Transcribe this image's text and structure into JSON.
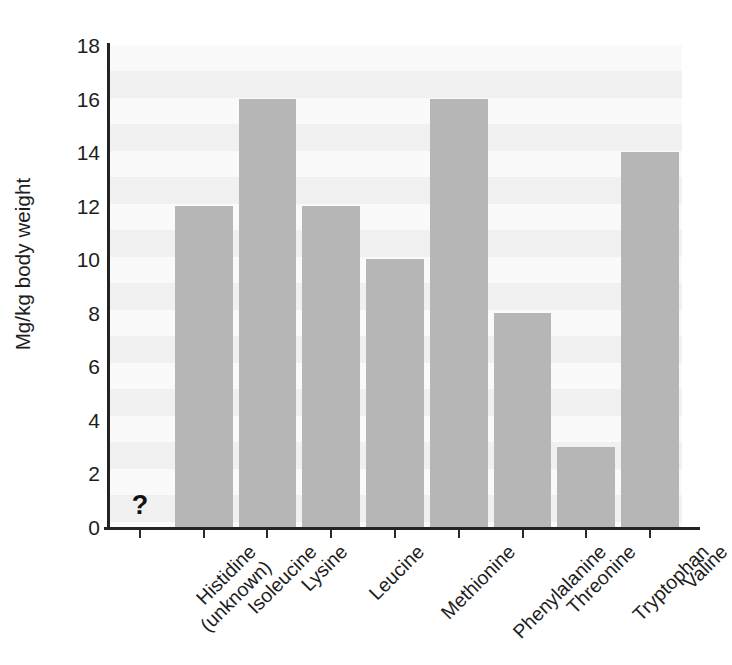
{
  "chart_data": {
    "type": "bar",
    "title": "",
    "subtitle": "",
    "xlabel": "",
    "ylabel": "Mg/kg body weight",
    "ylim": [
      0,
      18
    ],
    "ytick_step": 2,
    "yticks": [
      18,
      16,
      14,
      12,
      10,
      8,
      6,
      4,
      2,
      0
    ],
    "grid": false,
    "legend": null,
    "categories": [
      "Histidine (unknown)",
      "Isoleucine",
      "Lysine",
      "Leucine",
      "Methionine",
      "Phenylalanine",
      "Threonine",
      "Tryptophan",
      "Valine"
    ],
    "category_lines": [
      [
        "Histidine",
        "(unknown)"
      ],
      [
        "Isoleucine",
        ""
      ],
      [
        "Lysine",
        ""
      ],
      [
        "Leucine",
        ""
      ],
      [
        "Methionine",
        ""
      ],
      [
        "Phenylalanine",
        ""
      ],
      [
        "Threonine",
        ""
      ],
      [
        "Tryptophan",
        ""
      ],
      [
        "Valine",
        ""
      ]
    ],
    "values": [
      null,
      12,
      16,
      12,
      10,
      16,
      8,
      3,
      14
    ],
    "annotations": [
      {
        "category": "Histidine (unknown)",
        "text": "?",
        "note": "value unknown, question mark drawn at baseline"
      }
    ],
    "colors": {
      "bar": "#b6b6b6",
      "plot_background": "#f3f3f3",
      "axis": "#232323",
      "text": "#1d1d1d",
      "page_background": "#ffffff"
    }
  }
}
